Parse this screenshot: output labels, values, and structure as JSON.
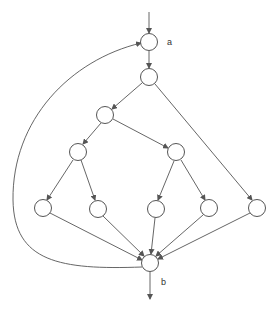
{
  "diagram": {
    "type": "control-flow-graph",
    "nodes": [
      {
        "id": "a",
        "x": 149,
        "y": 42,
        "label": "a"
      },
      {
        "id": "n1",
        "x": 149,
        "y": 77,
        "label": ""
      },
      {
        "id": "n2",
        "x": 105,
        "y": 115,
        "label": ""
      },
      {
        "id": "n3",
        "x": 78,
        "y": 152,
        "label": ""
      },
      {
        "id": "n4",
        "x": 176,
        "y": 152,
        "label": ""
      },
      {
        "id": "n5",
        "x": 43,
        "y": 208,
        "label": ""
      },
      {
        "id": "n6",
        "x": 98,
        "y": 209,
        "label": ""
      },
      {
        "id": "n7",
        "x": 156,
        "y": 209,
        "label": ""
      },
      {
        "id": "n8",
        "x": 209,
        "y": 208,
        "label": ""
      },
      {
        "id": "n9",
        "x": 257,
        "y": 208,
        "label": ""
      },
      {
        "id": "b",
        "x": 150,
        "y": 263,
        "label": "b"
      }
    ],
    "edges": [
      [
        "entry",
        "a"
      ],
      [
        "a",
        "n1"
      ],
      [
        "n1",
        "n2"
      ],
      [
        "n1",
        "n9"
      ],
      [
        "n2",
        "n3"
      ],
      [
        "n2",
        "n4"
      ],
      [
        "n3",
        "n5"
      ],
      [
        "n3",
        "n6"
      ],
      [
        "n4",
        "n7"
      ],
      [
        "n4",
        "n8"
      ],
      [
        "n5",
        "b"
      ],
      [
        "n6",
        "b"
      ],
      [
        "n7",
        "b"
      ],
      [
        "n8",
        "b"
      ],
      [
        "n9",
        "b"
      ],
      [
        "b",
        "a"
      ],
      [
        "b",
        "exit"
      ]
    ],
    "labels": {
      "a": "a",
      "b": "b"
    }
  }
}
